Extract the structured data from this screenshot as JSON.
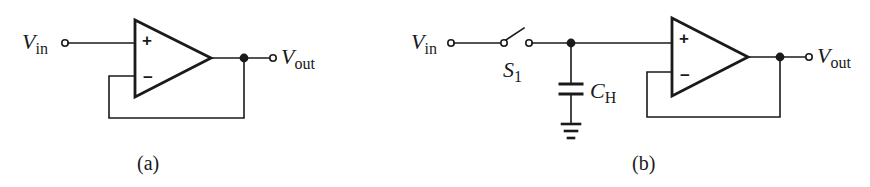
{
  "figure": {
    "panels": [
      {
        "id": "a",
        "caption": "(a)",
        "description": "Unity-gain buffer (voltage follower)",
        "input": {
          "symbol": "V",
          "subscript": "in"
        },
        "output": {
          "symbol": "V",
          "subscript": "out"
        },
        "opamp": {
          "plus_label": "+",
          "minus_label": "−"
        }
      },
      {
        "id": "b",
        "caption": "(b)",
        "description": "Sample-and-hold with switch, hold capacitor and unity-gain buffer",
        "input": {
          "symbol": "V",
          "subscript": "in"
        },
        "switch": {
          "symbol": "S",
          "subscript": "1"
        },
        "capacitor": {
          "symbol": "C",
          "subscript": "H"
        },
        "output": {
          "symbol": "V",
          "subscript": "out"
        },
        "opamp": {
          "plus_label": "+",
          "minus_label": "−"
        }
      }
    ],
    "colors": {
      "ink": "#1a1a1a",
      "background": "#ffffff"
    }
  }
}
